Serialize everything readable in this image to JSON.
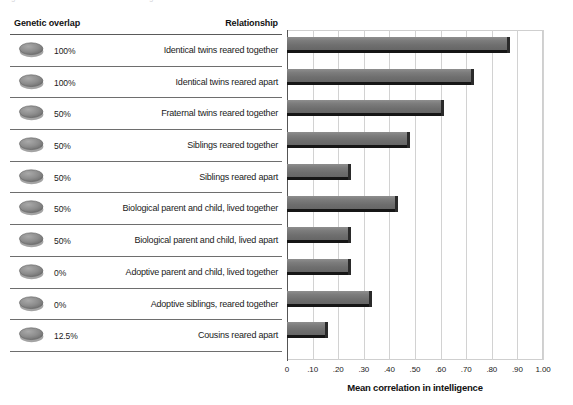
{
  "caption": {
    "cut_off_text": "Figure  ·  Genetic relatedness and intelligence correlations"
  },
  "table": {
    "header_left": "Genetic overlap",
    "header_right": "Relationship",
    "rows": [
      {
        "overlap": "100%",
        "relationship": "Identical twins reared together",
        "icon": "gray-disc-icon"
      },
      {
        "overlap": "100%",
        "relationship": "Identical twins reared apart",
        "icon": "gray-disc-icon"
      },
      {
        "overlap": "50%",
        "relationship": "Fraternal twins reared together",
        "icon": "gray-disc-icon"
      },
      {
        "overlap": "50%",
        "relationship": "Siblings reared together",
        "icon": "gray-disc-icon"
      },
      {
        "overlap": "50%",
        "relationship": "Siblings reared apart",
        "icon": "gray-disc-icon"
      },
      {
        "overlap": "50%",
        "relationship": "Biological parent and child, lived together",
        "icon": "gray-disc-icon"
      },
      {
        "overlap": "50%",
        "relationship": "Biological parent and child, lived apart",
        "icon": "gray-disc-icon"
      },
      {
        "overlap": "0%",
        "relationship": "Adoptive parent and child, lived together",
        "icon": "gray-disc-icon"
      },
      {
        "overlap": "0%",
        "relationship": "Adoptive siblings, reared together",
        "icon": "gray-disc-icon"
      },
      {
        "overlap": "12.5%",
        "relationship": "Cousins reared apart",
        "icon": "gray-disc-icon"
      }
    ]
  },
  "chart_data": {
    "type": "bar",
    "orientation": "horizontal",
    "title": "",
    "xlabel": "Mean correlation in intelligence",
    "ylabel": "",
    "xlim": [
      0,
      1.0
    ],
    "grid": true,
    "legend": null,
    "tick_labels": [
      "0",
      ".10",
      ".20",
      ".30",
      ".40",
      ".50",
      ".60",
      ".70",
      ".80",
      ".90",
      "1.00"
    ],
    "tick_values": [
      0,
      0.1,
      0.2,
      0.3,
      0.4,
      0.5,
      0.6,
      0.7,
      0.8,
      0.9,
      1.0
    ],
    "categories": [
      "Identical twins reared together",
      "Identical twins reared apart",
      "Fraternal twins reared together",
      "Siblings reared together",
      "Siblings reared apart",
      "Biological parent and child, lived together",
      "Biological parent and child, lived apart",
      "Adoptive parent and child, lived together",
      "Adoptive siblings, reared together",
      "Cousins reared apart"
    ],
    "values": [
      0.86,
      0.72,
      0.6,
      0.47,
      0.24,
      0.42,
      0.24,
      0.24,
      0.32,
      0.15
    ],
    "bar_color": "#7c7c7c",
    "bar_shadow_color": "#161616",
    "grid_color": "#d2d2d2",
    "axis_color": "#555555"
  }
}
